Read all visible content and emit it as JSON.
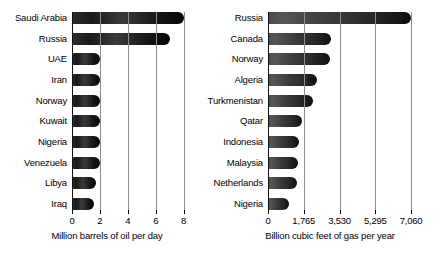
{
  "chart_data": [
    {
      "type": "bar",
      "orientation": "horizontal",
      "title": "",
      "xlabel": "Million barrels of oil per day",
      "ylabel": "",
      "xlim": [
        0,
        8.6
      ],
      "xticks": [
        0,
        2,
        4,
        6,
        8
      ],
      "xticklabels": [
        "0",
        "2",
        "4",
        "6",
        "8"
      ],
      "grid": true,
      "grid_axis": "x",
      "legend": false,
      "categories": [
        "Saudi Arabia",
        "Russia",
        "UAE",
        "Iran",
        "Norway",
        "Kuwait",
        "Nigeria",
        "Venezuela",
        "Libya",
        "Iraq"
      ],
      "values": [
        8.0,
        7.0,
        2.0,
        2.0,
        2.0,
        2.0,
        2.0,
        2.0,
        1.7,
        1.6
      ]
    },
    {
      "type": "bar",
      "orientation": "horizontal",
      "title": "",
      "xlabel": "Billion cubic feet of gas per year",
      "ylabel": "",
      "xlim": [
        0,
        7600
      ],
      "xticks": [
        0,
        1765,
        3530,
        5295,
        7060
      ],
      "xticklabels": [
        "0",
        "1,765",
        "3,530",
        "5,295",
        "7,060"
      ],
      "grid": true,
      "grid_axis": "x",
      "legend": false,
      "categories": [
        "Russia",
        "Canada",
        "Norway",
        "Algeria",
        "Turkmenistan",
        "Qatar",
        "Indonesia",
        "Malaysia",
        "Netherlands",
        "Nigeria"
      ],
      "values": [
        7060,
        3100,
        3050,
        2400,
        2200,
        1700,
        1550,
        1500,
        1450,
        1050
      ]
    }
  ]
}
